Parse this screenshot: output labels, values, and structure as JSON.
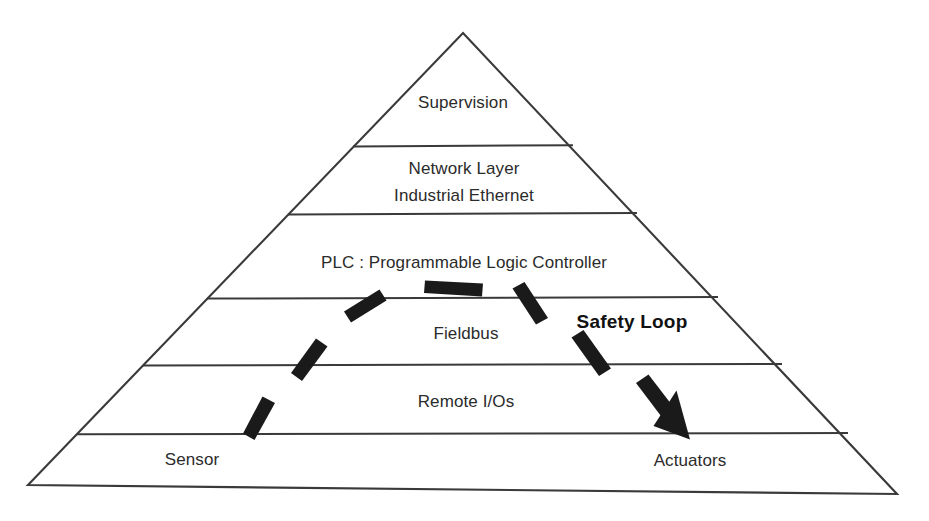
{
  "diagram": {
    "type": "pyramid-hierarchy",
    "background_color": "#ffffff",
    "outline_color": "#3a3a3a",
    "dash_color": "#1a1a1a",
    "text_color": "#2b2b2b"
  },
  "levels": [
    {
      "index": 0,
      "name": "supervision",
      "label": "Supervision",
      "label_lines": [
        "Supervision"
      ],
      "label_x": 463,
      "label_y": 103
    },
    {
      "index": 1,
      "name": "network-layer",
      "label": "Network Layer Industrial Ethernet",
      "label_lines": [
        "Network Layer",
        "Industrial Ethernet"
      ],
      "label_x": 464,
      "label_y": 182
    },
    {
      "index": 2,
      "name": "plc",
      "label": "PLC : Programmable Logic Controller",
      "label_lines": [
        "PLC : Programmable Logic Controller"
      ],
      "label_x": 464,
      "label_y": 263
    },
    {
      "index": 3,
      "name": "fieldbus",
      "label": "Fieldbus",
      "label_lines": [
        "Fieldbus"
      ],
      "label_x": 466,
      "label_y": 334
    },
    {
      "index": 4,
      "name": "remote-ios",
      "label": "Remote I/Os",
      "label_lines": [
        "Remote I/Os"
      ],
      "label_x": 466,
      "label_y": 402
    },
    {
      "index": 5,
      "name": "sensor",
      "label": "Sensor",
      "label_lines": [
        "Sensor"
      ],
      "label_x": 192,
      "label_y": 460
    },
    {
      "index": 6,
      "name": "actuators",
      "label": "Actuators",
      "label_lines": [
        "Actuators"
      ],
      "label_x": 690,
      "label_y": 461
    }
  ],
  "annotations": [
    {
      "name": "safety-loop",
      "label": "Safety Loop",
      "label_x": 632,
      "label_y": 322,
      "bold": true
    }
  ],
  "geometry": {
    "apex_x": 463,
    "apex_y": 33,
    "base_left_x": 28,
    "base_left_y": 485,
    "base_right_x": 897,
    "base_right_y": 494,
    "divider_y": [
      146,
      214,
      298,
      365,
      434
    ]
  },
  "safety_loop_arrow": {
    "description": "dashed counter-clockwise arc from Sensor up through Fieldbus and across to Actuators, ending in a solid arrowhead",
    "dash_count": 7,
    "arrowhead_tip_x": 690,
    "arrowhead_tip_y": 437
  }
}
